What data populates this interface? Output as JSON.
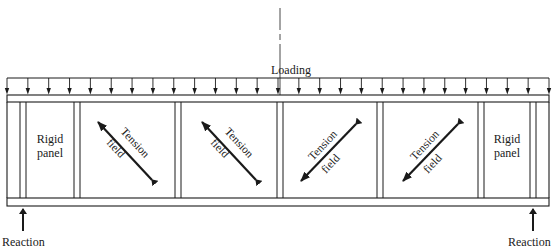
{
  "diagram": {
    "loading_label": "Loading",
    "load_arrow_count": 27,
    "colors": {
      "line": "#1a1a1a",
      "background": "#ffffff"
    },
    "panels": [
      {
        "type": "rigid",
        "label_line1": "Rigid",
        "label_line2": "panel"
      },
      {
        "type": "tension",
        "label_top": "Tension",
        "label_bottom": "field",
        "direction": "down-right"
      },
      {
        "type": "tension",
        "label_top": "Tension",
        "label_bottom": "field",
        "direction": "down-right"
      },
      {
        "type": "tension",
        "label_top": "Tension",
        "label_bottom": "field",
        "direction": "up-right"
      },
      {
        "type": "tension",
        "label_top": "Tension",
        "label_bottom": "field",
        "direction": "up-right"
      },
      {
        "type": "rigid",
        "label_line1": "Rigid",
        "label_line2": "panel"
      }
    ],
    "reactions": {
      "left_label": "Reaction",
      "right_label": "Reaction"
    }
  }
}
